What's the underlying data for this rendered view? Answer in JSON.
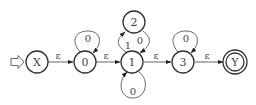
{
  "diagram": {
    "type": "finite-automaton",
    "states": [
      {
        "id": "X",
        "label": "X",
        "initial": true,
        "accepting": false
      },
      {
        "id": "0",
        "label": "0",
        "initial": false,
        "accepting": false
      },
      {
        "id": "1",
        "label": "1",
        "initial": false,
        "accepting": false
      },
      {
        "id": "2",
        "label": "2",
        "initial": false,
        "accepting": false
      },
      {
        "id": "3",
        "label": "3",
        "initial": false,
        "accepting": false
      },
      {
        "id": "Y",
        "label": "Y",
        "initial": false,
        "accepting": true
      }
    ],
    "transitions": [
      {
        "from": "X",
        "to": "0",
        "label": "ε"
      },
      {
        "from": "0",
        "to": "0",
        "label": "0"
      },
      {
        "from": "0",
        "to": "1",
        "label": "ε"
      },
      {
        "from": "1",
        "to": "2",
        "label": "1"
      },
      {
        "from": "2",
        "to": "1",
        "label": "0"
      },
      {
        "from": "1",
        "to": "1",
        "label": "0"
      },
      {
        "from": "1",
        "to": "3",
        "label": "ε"
      },
      {
        "from": "3",
        "to": "3",
        "label": "0"
      },
      {
        "from": "3",
        "to": "Y",
        "label": "ε"
      }
    ]
  }
}
